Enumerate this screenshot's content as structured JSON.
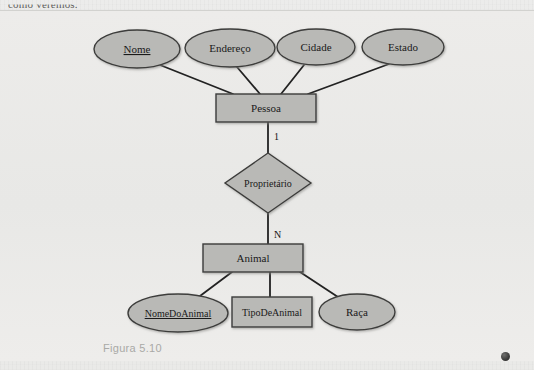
{
  "page": {
    "running_text": "como veremos.",
    "caption": "Figura 5.10",
    "marker": "page-dot"
  },
  "colors": {
    "paper": "#e9e9e7",
    "shape_fill": "#b9b9b6",
    "shape_stroke": "#3c3c3b",
    "connector": "#222222",
    "text": "#1a1a1a",
    "caption": "#a9a9a6"
  },
  "diagram": {
    "type": "entity-relationship-chen",
    "entities": [
      {
        "id": "pessoa",
        "label": "Pessoa",
        "shape": "rectangle",
        "x": 216,
        "y": 83,
        "w": 100,
        "h": 28
      },
      {
        "id": "animal",
        "label": "Animal",
        "shape": "rectangle",
        "x": 203,
        "y": 233,
        "w": 100,
        "h": 28
      }
    ],
    "relationships": [
      {
        "id": "proprietario",
        "label": "Proprietário",
        "shape": "diamond",
        "cx": 270,
        "cy": 172,
        "rx": 42,
        "ry": 30
      }
    ],
    "attributes": [
      {
        "id": "nome",
        "label": "Nome",
        "shape": "ellipse",
        "underlined": true,
        "owner": "pessoa",
        "cx": 137,
        "cy": 38,
        "rx": 43,
        "ry": 19
      },
      {
        "id": "endereco",
        "label": "Endereço",
        "shape": "ellipse",
        "underlined": false,
        "owner": "pessoa",
        "cx": 230,
        "cy": 37,
        "rx": 45,
        "ry": 19
      },
      {
        "id": "cidade",
        "label": "Cidade",
        "shape": "ellipse",
        "underlined": false,
        "owner": "pessoa",
        "cx": 316,
        "cy": 36,
        "rx": 39,
        "ry": 18
      },
      {
        "id": "estado",
        "label": "Estado",
        "shape": "ellipse",
        "underlined": false,
        "owner": "pessoa",
        "cx": 403,
        "cy": 36,
        "rx": 41,
        "ry": 18
      },
      {
        "id": "nomedoanimal",
        "label": "NomeDoAnimal",
        "shape": "ellipse",
        "underlined": true,
        "owner": "animal",
        "cx": 178,
        "cy": 302,
        "rx": 50,
        "ry": 19
      },
      {
        "id": "tipodeanimal",
        "label": "TipoDeAnimal",
        "shape": "rectangle",
        "underlined": false,
        "owner": "animal",
        "x": 232,
        "y": 286,
        "w": 80,
        "h": 30
      },
      {
        "id": "raca",
        "label": "Raça",
        "shape": "ellipse",
        "underlined": false,
        "owner": "animal",
        "cx": 357,
        "cy": 301,
        "rx": 38,
        "ry": 18
      }
    ],
    "cardinalities": [
      {
        "id": "card-pessoa",
        "label": "1",
        "x": 274,
        "y": 126
      },
      {
        "id": "card-animal",
        "label": "N",
        "x": 274,
        "y": 224
      }
    ],
    "connectors": [
      {
        "from": "nome",
        "to": "pessoa",
        "x1": 160,
        "y1": 54,
        "x2": 233,
        "y2": 83
      },
      {
        "from": "endereco",
        "to": "pessoa",
        "x1": 237,
        "y1": 56,
        "x2": 260,
        "y2": 83
      },
      {
        "from": "cidade",
        "to": "pessoa",
        "x1": 304,
        "y1": 54,
        "x2": 281,
        "y2": 83
      },
      {
        "from": "estado",
        "to": "pessoa",
        "x1": 389,
        "y1": 53,
        "x2": 308,
        "y2": 83
      },
      {
        "from": "pessoa",
        "to": "proprietario",
        "x1": 268,
        "y1": 111,
        "x2": 268,
        "y2": 142
      },
      {
        "from": "proprietario",
        "to": "animal",
        "x1": 268,
        "y1": 202,
        "x2": 268,
        "y2": 233
      },
      {
        "from": "animal",
        "to": "nomedoanimal",
        "x1": 232,
        "y1": 261,
        "x2": 196,
        "y2": 287
      },
      {
        "from": "animal",
        "to": "tipodeanimal",
        "x1": 270,
        "y1": 261,
        "x2": 270,
        "y2": 286
      },
      {
        "from": "animal",
        "to": "raca",
        "x1": 300,
        "y1": 261,
        "x2": 341,
        "y2": 287
      }
    ]
  }
}
